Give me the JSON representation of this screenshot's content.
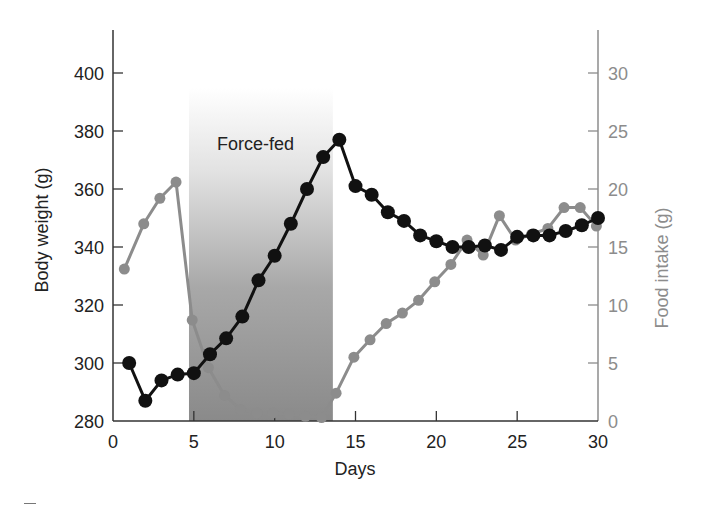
{
  "chart_data": {
    "type": "line",
    "title": "",
    "xlabel": "Days",
    "ylabel": "Body weight (g)",
    "y2label": "Food intake (g)",
    "xlim": [
      0,
      30
    ],
    "ylim": [
      280,
      400
    ],
    "y2lim": [
      0,
      30
    ],
    "x_ticks": [
      0,
      5,
      10,
      15,
      20,
      25,
      30
    ],
    "y_ticks": [
      280,
      300,
      320,
      340,
      360,
      380,
      400
    ],
    "y2_ticks": [
      0,
      5,
      10,
      15,
      20,
      25,
      30
    ],
    "grid": false,
    "legend": null,
    "annotation": {
      "label": "Force-fed",
      "x_start": 4.7,
      "x_end": 13.6
    },
    "series": [
      {
        "name": "Body weight (g)",
        "axis": "left",
        "color": "#111111",
        "x": [
          1,
          2,
          3,
          4,
          5,
          6,
          7,
          8,
          9,
          10,
          11,
          12,
          13,
          14,
          15,
          16,
          17,
          18,
          19,
          20,
          21,
          22,
          23,
          24,
          25,
          26,
          27,
          28,
          29,
          30
        ],
        "values": [
          300,
          287,
          294,
          296,
          296.5,
          303,
          308.5,
          316,
          328.5,
          337,
          348,
          360,
          371,
          377,
          361,
          358,
          352,
          349,
          344,
          342,
          340,
          340,
          340.5,
          339,
          343.5,
          344,
          344,
          345.5,
          347.5,
          350
        ]
      },
      {
        "name": "Food intake (g)",
        "axis": "right",
        "color": "#8c8c8c",
        "x": [
          0.7,
          1.9,
          2.9,
          3.9,
          4.9,
          5.9,
          6.9,
          7.9,
          8.9,
          9.9,
          10.9,
          11.9,
          12.9,
          13.8,
          14.9,
          15.9,
          16.9,
          17.9,
          18.9,
          19.9,
          20.9,
          21.9,
          22.9,
          23.9,
          24.9,
          25.9,
          26.9,
          27.9,
          28.9,
          29.9
        ],
        "values": [
          13.1,
          17,
          19.2,
          20.6,
          8.7,
          4.6,
          2.2,
          1,
          0.7,
          0.7,
          0.6,
          0.4,
          0.3,
          2.4,
          5.5,
          7,
          8.4,
          9.3,
          10.4,
          12,
          13.5,
          15.6,
          14.3,
          17.7,
          15.6,
          16.1,
          16.6,
          18.4,
          18.4,
          16.8
        ]
      }
    ]
  },
  "labels": {
    "xlabel": "Days",
    "ylabel": "Body weight (g)",
    "y2label": "Food intake (g)",
    "annotation": "Force-fed"
  },
  "colors": {
    "body_weight": "#111111",
    "food_intake": "#8c8c8c",
    "left_axis": "#333333",
    "right_axis": "#8c8c8c",
    "band_bottom": "#8a8a8a"
  }
}
